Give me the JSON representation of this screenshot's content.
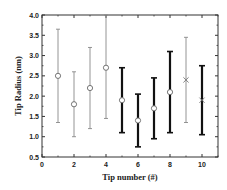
{
  "chart_data": {
    "type": "scatter",
    "title": "",
    "xlabel": "Tip number (#)",
    "ylabel": "Tip Radius (nm)",
    "xlim": [
      0,
      11
    ],
    "ylim": [
      0.5,
      4.0
    ],
    "xticks": [
      0,
      2,
      4,
      6,
      8,
      10
    ],
    "xtick_labels": [
      "0",
      "2",
      "4",
      "6",
      "8",
      "10"
    ],
    "yticks": [
      0.5,
      1.0,
      1.5,
      2.0,
      2.5,
      3.0,
      3.5,
      4.0
    ],
    "ytick_labels": [
      "0.5",
      "1.0",
      "1.5",
      "2.0",
      "2.5",
      "3.0",
      "3.5",
      "4.0"
    ],
    "grid": false,
    "legend": null,
    "series": [
      {
        "name": "gray-circle",
        "marker": "circle",
        "errorbar_style": "thin",
        "color": "#888888",
        "points": [
          {
            "x": 1,
            "y": 2.5,
            "ylow": 1.35,
            "yhigh": 3.65
          },
          {
            "x": 2,
            "y": 1.8,
            "ylow": 1.0,
            "yhigh": 2.6
          },
          {
            "x": 3,
            "y": 2.2,
            "ylow": 1.2,
            "yhigh": 3.2
          },
          {
            "x": 4,
            "y": 2.7,
            "ylow": 1.45,
            "yhigh": 4.0
          }
        ]
      },
      {
        "name": "black-circle",
        "marker": "circle",
        "errorbar_style": "thick",
        "color": "#111111",
        "points": [
          {
            "x": 5,
            "y": 1.9,
            "ylow": 1.1,
            "yhigh": 2.7
          },
          {
            "x": 6,
            "y": 1.4,
            "ylow": 0.75,
            "yhigh": 2.05
          },
          {
            "x": 7,
            "y": 1.7,
            "ylow": 0.95,
            "yhigh": 2.45
          },
          {
            "x": 8,
            "y": 2.1,
            "ylow": 1.1,
            "yhigh": 3.1
          }
        ]
      },
      {
        "name": "gray-cross",
        "marker": "x",
        "errorbar_style": "thin",
        "color": "#888888",
        "points": [
          {
            "x": 9,
            "y": 2.4,
            "ylow": 1.35,
            "yhigh": 3.45
          }
        ]
      },
      {
        "name": "black-cross",
        "marker": "x",
        "errorbar_style": "thick",
        "color": "#111111",
        "points": [
          {
            "x": 10,
            "y": 1.9,
            "ylow": 1.05,
            "yhigh": 2.75
          }
        ]
      }
    ]
  },
  "layout": {
    "plot_left": 42,
    "plot_top": 15,
    "plot_right": 218,
    "plot_bottom": 157
  }
}
